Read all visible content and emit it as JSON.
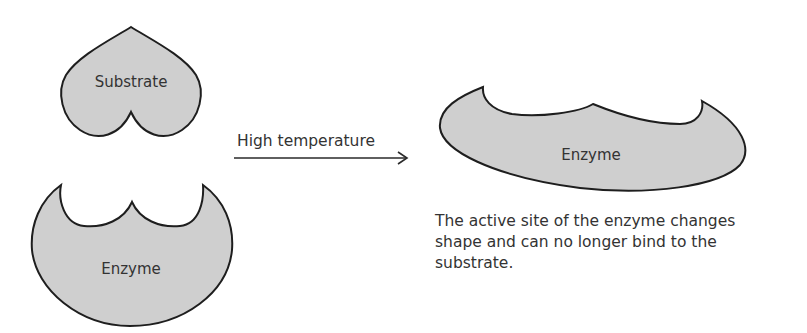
{
  "diagram": {
    "colors": {
      "shape_fill": "#cfcfcf",
      "shape_stroke": "#1e1e1e",
      "text": "#333333",
      "background": "#ffffff"
    },
    "left": {
      "substrate": {
        "label": "Substrate",
        "shape": "heart-icon"
      },
      "enzyme": {
        "label": "Enzyme",
        "shape": "enzyme-with-active-site"
      }
    },
    "arrow": {
      "label": "High temperature",
      "direction": "right"
    },
    "right": {
      "enzyme": {
        "label": "Enzyme",
        "shape": "denatured-enzyme"
      },
      "caption": "The active site of the enzyme changes shape and can no longer bind to the substrate."
    }
  }
}
